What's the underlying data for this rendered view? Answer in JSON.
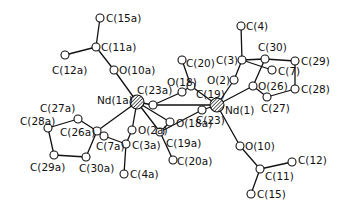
{
  "figure": {
    "colors": {
      "ink": "#111111",
      "background": "#ffffff"
    },
    "atoms": [
      {
        "id": "C15a",
        "label": "C(15a)",
        "x": 100,
        "y": 18,
        "lx": 106,
        "ly": 22,
        "type": "C"
      },
      {
        "id": "C11a",
        "label": "C(11a)",
        "x": 96,
        "y": 47,
        "lx": 101,
        "ly": 51,
        "type": "C"
      },
      {
        "id": "C12a",
        "label": "C(12a)",
        "x": 65,
        "y": 55,
        "lx": 52,
        "ly": 74,
        "type": "C"
      },
      {
        "id": "O10a",
        "label": "O(10a)",
        "x": 114,
        "y": 70,
        "lx": 119,
        "ly": 74,
        "type": "O"
      },
      {
        "id": "Nd1a",
        "label": "Nd(1a)",
        "x": 137,
        "y": 102,
        "lx": 97,
        "ly": 104,
        "type": "Nd"
      },
      {
        "id": "C23a",
        "label": "C(23a)",
        "x": 153,
        "y": 105,
        "lx": 137,
        "ly": 94,
        "type": "C"
      },
      {
        "id": "O18",
        "label": "O(18)",
        "x": 182,
        "y": 92,
        "lx": 167,
        "ly": 86,
        "type": "O"
      },
      {
        "id": "C19",
        "label": "C(19)",
        "x": 191,
        "y": 86,
        "lx": 196,
        "ly": 98,
        "type": "C"
      },
      {
        "id": "C20",
        "label": "C(20)",
        "x": 182,
        "y": 60,
        "lx": 186,
        "ly": 67,
        "type": "C"
      },
      {
        "id": "C3",
        "label": "C(3)",
        "x": 242,
        "y": 60,
        "lx": 216,
        "ly": 64,
        "type": "C"
      },
      {
        "id": "C4",
        "label": "C(4)",
        "x": 241,
        "y": 26,
        "lx": 246,
        "ly": 30,
        "type": "C"
      },
      {
        "id": "O2",
        "label": "O(2)",
        "x": 234,
        "y": 80,
        "lx": 207,
        "ly": 84,
        "type": "O"
      },
      {
        "id": "C7",
        "label": "C(7)",
        "x": 272,
        "y": 70,
        "lx": 278,
        "ly": 75,
        "type": "C"
      },
      {
        "id": "C30",
        "label": "C(30)",
        "x": 265,
        "y": 59,
        "lx": 258,
        "ly": 51,
        "type": "C"
      },
      {
        "id": "C29",
        "label": "C(29)",
        "x": 295,
        "y": 61,
        "lx": 301,
        "ly": 65,
        "type": "C"
      },
      {
        "id": "C28",
        "label": "C(28)",
        "x": 295,
        "y": 89,
        "lx": 301,
        "ly": 93,
        "type": "C"
      },
      {
        "id": "O26",
        "label": "O(26)",
        "x": 253,
        "y": 86,
        "lx": 258,
        "ly": 90,
        "type": "O"
      },
      {
        "id": "C27",
        "label": "C(27)",
        "x": 267,
        "y": 97,
        "lx": 261,
        "ly": 112,
        "type": "C"
      },
      {
        "id": "Nd1",
        "label": "Nd(1)",
        "x": 217,
        "y": 105,
        "lx": 225,
        "ly": 114,
        "type": "Nd"
      },
      {
        "id": "C23",
        "label": "C(23)",
        "x": 202,
        "y": 110,
        "lx": 196,
        "ly": 124,
        "type": "C"
      },
      {
        "id": "O18a",
        "label": "O(18a)",
        "x": 170,
        "y": 122,
        "lx": 176,
        "ly": 127,
        "type": "O"
      },
      {
        "id": "C19a",
        "label": "C(19a)",
        "x": 160,
        "y": 132,
        "lx": 166,
        "ly": 147,
        "type": "C"
      },
      {
        "id": "C20a",
        "label": "C(20a)",
        "x": 173,
        "y": 160,
        "lx": 177,
        "ly": 165,
        "type": "C"
      },
      {
        "id": "O10",
        "label": "O(10)",
        "x": 240,
        "y": 146,
        "lx": 245,
        "ly": 150,
        "type": "O"
      },
      {
        "id": "C11",
        "label": "C(11)",
        "x": 260,
        "y": 169,
        "lx": 265,
        "ly": 180,
        "type": "C"
      },
      {
        "id": "C12",
        "label": "C(12)",
        "x": 292,
        "y": 162,
        "lx": 298,
        "ly": 164,
        "type": "C"
      },
      {
        "id": "C15",
        "label": "C(15)",
        "x": 251,
        "y": 194,
        "lx": 257,
        "ly": 198,
        "type": "C"
      },
      {
        "id": "O2a",
        "label": "O(2a)",
        "x": 132,
        "y": 130,
        "lx": 138,
        "ly": 134,
        "type": "O"
      },
      {
        "id": "C3a",
        "label": "C(3a)",
        "x": 126,
        "y": 144,
        "lx": 132,
        "ly": 149,
        "type": "C"
      },
      {
        "id": "C4a",
        "label": "C(4a)",
        "x": 124,
        "y": 174,
        "lx": 130,
        "ly": 178,
        "type": "C"
      },
      {
        "id": "C7a",
        "label": "C(7a)",
        "x": 104,
        "y": 136,
        "lx": 96,
        "ly": 150,
        "type": "C"
      },
      {
        "id": "C26a",
        "label": "C(26a)",
        "x": 97,
        "y": 131,
        "lx": 60,
        "ly": 136,
        "type": "C"
      },
      {
        "id": "C27a",
        "label": "C(27a)",
        "x": 78,
        "y": 119,
        "lx": 40,
        "ly": 112,
        "type": "C"
      },
      {
        "id": "C28a",
        "label": "C(28a)",
        "x": 48,
        "y": 128,
        "lx": 20,
        "ly": 125,
        "type": "C"
      },
      {
        "id": "C29a",
        "label": "C(29a)",
        "x": 54,
        "y": 155,
        "lx": 30,
        "ly": 171,
        "type": "C"
      },
      {
        "id": "C30a",
        "label": "C(30a)",
        "x": 86,
        "y": 157,
        "lx": 79,
        "ly": 172,
        "type": "C"
      }
    ],
    "bonds": [
      [
        "C15a",
        "C11a"
      ],
      [
        "C11a",
        "C12a"
      ],
      [
        "C11a",
        "O10a"
      ],
      [
        "O10a",
        "Nd1a"
      ],
      [
        "Nd1a",
        "C23a"
      ],
      [
        "C23a",
        "O18"
      ],
      [
        "O18",
        "C19"
      ],
      [
        "C19",
        "C20"
      ],
      [
        "C19",
        "Nd1"
      ],
      [
        "Nd1a",
        "O18a"
      ],
      [
        "O18a",
        "C19a"
      ],
      [
        "C19a",
        "C20a"
      ],
      [
        "C19a",
        "C23"
      ],
      [
        "C23",
        "Nd1"
      ],
      [
        "Nd1",
        "O2"
      ],
      [
        "O2",
        "C3"
      ],
      [
        "C3",
        "C4"
      ],
      [
        "C3",
        "C7"
      ],
      [
        "C3",
        "C30"
      ],
      [
        "C30",
        "C29"
      ],
      [
        "C29",
        "C28"
      ],
      [
        "C28",
        "C27"
      ],
      [
        "C27",
        "O26"
      ],
      [
        "O26",
        "Nd1"
      ],
      [
        "O26",
        "C30"
      ],
      [
        "Nd1",
        "O10"
      ],
      [
        "O10",
        "C11"
      ],
      [
        "C11",
        "C12"
      ],
      [
        "C11",
        "C15"
      ],
      [
        "Nd1a",
        "O2a"
      ],
      [
        "O2a",
        "C3a"
      ],
      [
        "C3a",
        "C4a"
      ],
      [
        "C3a",
        "C7a"
      ],
      [
        "Nd1a",
        "C26a"
      ],
      [
        "C26a",
        "C27a"
      ],
      [
        "C27a",
        "C28a"
      ],
      [
        "C28a",
        "C29a"
      ],
      [
        "C29a",
        "C30a"
      ],
      [
        "C30a",
        "C26a"
      ],
      [
        "C26a",
        "C7a"
      ],
      [
        "Nd1a",
        "C19a"
      ],
      [
        "C23a",
        "Nd1"
      ]
    ]
  }
}
